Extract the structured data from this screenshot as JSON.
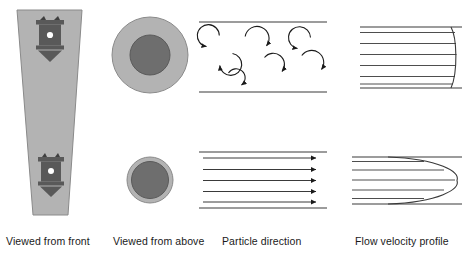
{
  "figure": {
    "rows": [
      {
        "name": "turbulent",
        "label": "turbulent flow (top row)"
      },
      {
        "name": "laminar",
        "label": "laminar flow (bottom row)"
      }
    ],
    "colors": {
      "pipe_fill": "#b3b3b3",
      "pipe_stroke": "#8a8a8a",
      "nozzle_dark": "#595959",
      "nozzle_dot": "#ffffff",
      "circle_outer_fill": "#b3b3b3",
      "circle_outer_stroke": "#8a8a8a",
      "circle_inner_fill": "#6e6e6e",
      "circle_inner_stroke": "#5a5a5a",
      "line_stroke": "#3a3a3a",
      "arrow_fill": "#1a1a1a",
      "caption_text": "#1a1a1a",
      "background": "#ffffff"
    }
  },
  "captions": [
    {
      "key": "front",
      "text": "Viewed from front",
      "x": 6
    },
    {
      "key": "above",
      "text": "Viewed from above",
      "x": 113
    },
    {
      "key": "particle",
      "text": "Particle direction",
      "x": 222
    },
    {
      "key": "velocity",
      "text": "Flow velocity profile",
      "x": 355
    }
  ],
  "column_front": {
    "name": "viewed-from-front",
    "shape": "tapered pipe narrowing downward",
    "nozzles": [
      {
        "key": "upper-nozzle",
        "cy": 38
      },
      {
        "key": "lower-nozzle",
        "cy": 175
      }
    ]
  },
  "column_above": {
    "name": "viewed-from-above",
    "circles": [
      {
        "key": "turbulent-cross-section",
        "cx": 150,
        "cy": 55,
        "r_outer": 38,
        "r_inner": 20
      },
      {
        "key": "laminar-cross-section",
        "cx": 150,
        "cy": 180,
        "r_outer": 23,
        "r_inner": 19
      }
    ]
  },
  "column_particle": {
    "name": "particle-direction",
    "turbulent": {
      "description": "chaotic circular eddies between duct walls",
      "wall_top_y": 22,
      "wall_bottom_y": 92,
      "eddies": [
        {
          "cx": 212,
          "cy": 42,
          "r": 11,
          "start": 110,
          "sweep": 290,
          "dir": "ccw"
        },
        {
          "cx": 227,
          "cy": 62,
          "r": 11,
          "start": 300,
          "sweep": 290,
          "dir": "cw"
        },
        {
          "cx": 256,
          "cy": 42,
          "r": 12,
          "start": 170,
          "sweep": 280,
          "dir": "cw"
        },
        {
          "cx": 275,
          "cy": 64,
          "r": 11,
          "start": 200,
          "sweep": 285,
          "dir": "cw"
        },
        {
          "cx": 303,
          "cy": 44,
          "r": 11,
          "start": 120,
          "sweep": 285,
          "dir": "ccw"
        },
        {
          "cx": 312,
          "cy": 62,
          "r": 12,
          "start": 330,
          "sweep": 285,
          "dir": "cw"
        },
        {
          "cx": 236,
          "cy": 78,
          "r": 9,
          "start": 60,
          "sweep": 280,
          "dir": "cw"
        }
      ]
    },
    "laminar": {
      "description": "parallel streamlines with arrowheads",
      "wall_top_y": 152,
      "wall_bottom_y": 208,
      "arrow_x_start": 203,
      "arrow_x_end": 318,
      "arrow_ys": [
        158,
        170,
        181,
        192,
        202
      ]
    }
  },
  "column_velocity": {
    "name": "flow-velocity-profile",
    "turbulent": {
      "description": "blunt flat-topped velocity profile",
      "wall_top_y": 27,
      "wall_bottom_y": 88,
      "x_start": 360,
      "x_tip": 455,
      "streamline_ys": [
        33,
        44,
        55,
        66,
        77,
        84
      ]
    },
    "laminar": {
      "description": "parabolic velocity profile",
      "wall_top_y": 157,
      "wall_bottom_y": 204,
      "x_start": 352,
      "x_tip": 455,
      "streamline_ys": [
        161,
        170,
        180,
        190,
        199
      ]
    }
  }
}
